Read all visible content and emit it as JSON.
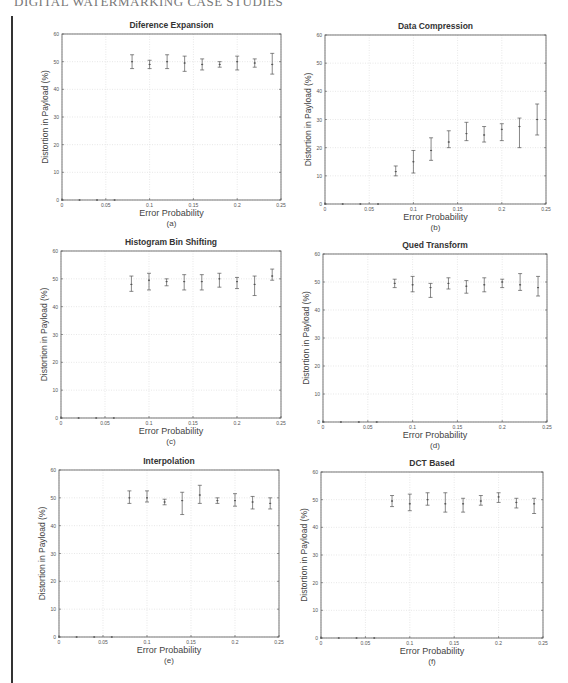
{
  "page": {
    "header": "DIGITAL WATERMARKING CASE STUDIES"
  },
  "chart_data": [
    {
      "type": "scatter",
      "subtype": "errorbar",
      "title": "Diference Expansion",
      "caption": "(a)",
      "xlabel": "Error Probability",
      "ylabel": "Distortion in Payload (%)",
      "xlim": [
        0,
        0.25
      ],
      "ylim": [
        0,
        60
      ],
      "xticks": [
        "0",
        "0.05",
        "0.1",
        "0.15",
        "0.2",
        "0.25"
      ],
      "yticks": [
        "0",
        "10",
        "20",
        "30",
        "40",
        "50",
        "60"
      ],
      "grid": true,
      "x": [
        0,
        0.02,
        0.04,
        0.06,
        0.08,
        0.1,
        0.12,
        0.14,
        0.16,
        0.18,
        0.2,
        0.22,
        0.24
      ],
      "y": [
        0,
        0,
        0,
        0,
        50,
        49,
        50,
        49.5,
        49,
        49,
        50,
        49.5,
        49
      ],
      "ylow": [
        0,
        0,
        0,
        0,
        47.5,
        47.5,
        47.5,
        46.5,
        47,
        48,
        47,
        48,
        45.5
      ],
      "yhigh": [
        0,
        0,
        0,
        0,
        52.5,
        50.5,
        52.5,
        52,
        51,
        50,
        52,
        51,
        53
      ]
    },
    {
      "type": "scatter",
      "subtype": "errorbar",
      "title": "Data Compression",
      "caption": "(b)",
      "xlabel": "Error Probability",
      "ylabel": "Distortion in Payload (%)",
      "xlim": [
        0,
        0.25
      ],
      "ylim": [
        0,
        60
      ],
      "xticks": [
        "0",
        "0.05",
        "0.1",
        "0.15",
        "0.2",
        "0.25"
      ],
      "yticks": [
        "0",
        "10",
        "20",
        "30",
        "40",
        "50",
        "60"
      ],
      "grid": true,
      "x": [
        0,
        0.02,
        0.04,
        0.06,
        0.08,
        0.1,
        0.12,
        0.14,
        0.16,
        0.18,
        0.2,
        0.22,
        0.24
      ],
      "y": [
        0,
        0,
        0,
        0,
        11.5,
        15,
        19,
        22,
        25,
        24.5,
        26.5,
        27.5,
        30
      ],
      "ylow": [
        0,
        0,
        0,
        0,
        10,
        11,
        15.5,
        20,
        22.5,
        22,
        22.5,
        20,
        24.5
      ],
      "yhigh": [
        0,
        0,
        0,
        0,
        13.5,
        19,
        23.5,
        26,
        29,
        27.5,
        28.5,
        30.5,
        35.5
      ]
    },
    {
      "type": "scatter",
      "subtype": "errorbar",
      "title": "Histogram Bin Shifting",
      "caption": "(c)",
      "xlabel": "Error Probability",
      "ylabel": "Distortion in Payload (%)",
      "xlim": [
        0,
        0.25
      ],
      "ylim": [
        0,
        60
      ],
      "xticks": [
        "0",
        "0.05",
        "0.1",
        "0.15",
        "0.2",
        "0.25"
      ],
      "yticks": [
        "0",
        "10",
        "20",
        "30",
        "40",
        "50",
        "60"
      ],
      "grid": true,
      "x": [
        0,
        0.02,
        0.04,
        0.06,
        0.08,
        0.1,
        0.12,
        0.14,
        0.16,
        0.18,
        0.2,
        0.22,
        0.24
      ],
      "y": [
        0,
        0,
        0,
        0,
        48,
        49.5,
        49,
        49,
        49,
        50,
        49,
        48,
        51
      ],
      "ylow": [
        0,
        0,
        0,
        0,
        45.5,
        46,
        47.5,
        46,
        46,
        47,
        46.5,
        44,
        49.5
      ],
      "yhigh": [
        0,
        0,
        0,
        0,
        51,
        52,
        50,
        51.5,
        51.5,
        52,
        50.5,
        51,
        53.5
      ]
    },
    {
      "type": "scatter",
      "subtype": "errorbar",
      "title": "Qued Transform",
      "caption": "(d)",
      "xlabel": "Error Probability",
      "ylabel": "Distortion in Payload (%)",
      "xlim": [
        0,
        0.25
      ],
      "ylim": [
        0,
        60
      ],
      "xticks": [
        "0",
        "0.05",
        "0.1",
        "0.15",
        "0.2",
        "0.25"
      ],
      "yticks": [
        "0",
        "10",
        "20",
        "30",
        "40",
        "50",
        "60"
      ],
      "grid": true,
      "x": [
        0,
        0.02,
        0.04,
        0.06,
        0.08,
        0.1,
        0.12,
        0.14,
        0.16,
        0.18,
        0.2,
        0.22,
        0.24
      ],
      "y": [
        0,
        0,
        0,
        0,
        49.5,
        49,
        48,
        49.5,
        48.5,
        49,
        50,
        49,
        48
      ],
      "ylow": [
        0,
        0,
        0,
        0,
        48,
        46.5,
        44.5,
        47.5,
        46,
        46.5,
        48,
        47,
        45
      ],
      "yhigh": [
        0,
        0,
        0,
        0,
        51,
        52,
        49.5,
        51.5,
        50.5,
        51.5,
        51,
        53,
        52
      ]
    },
    {
      "type": "scatter",
      "subtype": "errorbar",
      "title": "Interpolation",
      "caption": "(e)",
      "xlabel": "Error Probability",
      "ylabel": "Distortion in Payload (%)",
      "xlim": [
        0,
        0.25
      ],
      "ylim": [
        0,
        60
      ],
      "xticks": [
        "0",
        "0.05",
        "0.1",
        "0.15",
        "0.2",
        "0.25"
      ],
      "yticks": [
        "0",
        "10",
        "20",
        "30",
        "40",
        "50",
        "60"
      ],
      "grid": true,
      "x": [
        0,
        0.02,
        0.04,
        0.06,
        0.08,
        0.1,
        0.12,
        0.14,
        0.16,
        0.18,
        0.2,
        0.22,
        0.24
      ],
      "y": [
        0,
        0,
        0,
        0,
        50,
        50,
        48.5,
        49,
        51,
        49,
        49,
        48.5,
        48
      ],
      "ylow": [
        0,
        0,
        0,
        0,
        48,
        48.5,
        47.5,
        44,
        48,
        48,
        47,
        46,
        46
      ],
      "yhigh": [
        0,
        0,
        0,
        0,
        52.5,
        52.5,
        49.5,
        52,
        54.5,
        50,
        51.5,
        50.5,
        50
      ]
    },
    {
      "type": "scatter",
      "subtype": "errorbar",
      "title": "DCT Based",
      "caption": "(f)",
      "xlabel": "Error Probability",
      "ylabel": "Distortion in Payload (%)",
      "xlim": [
        0,
        0.25
      ],
      "ylim": [
        0,
        60
      ],
      "xticks": [
        "0",
        "0.05",
        "0.1",
        "0.15",
        "0.2",
        "0.25"
      ],
      "yticks": [
        "0",
        "10",
        "20",
        "30",
        "40",
        "50",
        "60"
      ],
      "grid": true,
      "x": [
        0,
        0.02,
        0.04,
        0.06,
        0.08,
        0.1,
        0.12,
        0.14,
        0.16,
        0.18,
        0.2,
        0.22,
        0.24
      ],
      "y": [
        0,
        0,
        0,
        0,
        49.5,
        48.5,
        50,
        48.5,
        48.5,
        49.5,
        51,
        49,
        48.5
      ],
      "ylow": [
        0,
        0,
        0,
        0,
        47.5,
        46,
        48,
        45.5,
        45.5,
        48,
        49,
        47,
        45
      ],
      "yhigh": [
        0,
        0,
        0,
        0,
        51.5,
        52,
        52.5,
        52.5,
        50.5,
        51.5,
        52.5,
        50.5,
        50.5
      ]
    }
  ],
  "panels": [
    {
      "title": "Diference Expansion",
      "caption": "(a)",
      "xlabel": "Error Probability",
      "ylabel": "Distortion in Payload (%)"
    },
    {
      "title": "Data Compression",
      "caption": "(b)",
      "xlabel": "Error Probability",
      "ylabel": "Distortion in Payload (%)"
    },
    {
      "title": "Histogram Bin Shifting",
      "caption": "(c)",
      "xlabel": "Error Probability",
      "ylabel": "Distortion in Payload (%)"
    },
    {
      "title": "Qued Transform",
      "caption": "(d)",
      "xlabel": "Error Probability",
      "ylabel": "Distortion in Payload (%)"
    },
    {
      "title": "Interpolation",
      "caption": "(e)",
      "xlabel": "Error Probability",
      "ylabel": "Distortion in Payload (%)"
    },
    {
      "title": "DCT Based",
      "caption": "(f)",
      "xlabel": "Error Probability",
      "ylabel": "Distortion in Payload (%)"
    }
  ],
  "style": {
    "grid_color": "#d9d9d9",
    "axis_color": "#555555",
    "errorbar_color": "#555555",
    "text_color": "#444444"
  }
}
